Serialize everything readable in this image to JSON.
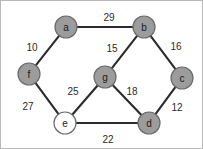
{
  "figure": {
    "background_color": "#ffffff",
    "border_color": "#b9b9b9",
    "edge_color": "#2b2b2b",
    "node_fill_gray": "#9c9c9c",
    "node_fill_white": "#ffffff",
    "node_stroke_color": "#6b6b6b",
    "label_color": "#1a1a1a"
  },
  "chart_data": {
    "type": "diagram",
    "subtype": "node-link-graph",
    "directed": false,
    "weighted": true,
    "title": "",
    "nodes": [
      {
        "id": "a",
        "label": "a",
        "x": 65,
        "y": 26,
        "r": 11,
        "fill": "#9c9c9c"
      },
      {
        "id": "b",
        "label": "b",
        "x": 143,
        "y": 26,
        "r": 11,
        "fill": "#9c9c9c"
      },
      {
        "id": "c",
        "label": "c",
        "x": 181,
        "y": 77,
        "r": 11,
        "fill": "#9c9c9c"
      },
      {
        "id": "d",
        "label": "d",
        "x": 148,
        "y": 122,
        "r": 11,
        "fill": "#9c9c9c"
      },
      {
        "id": "e",
        "label": "e",
        "x": 64,
        "y": 122,
        "r": 11,
        "fill": "#ffffff"
      },
      {
        "id": "f",
        "label": "f",
        "x": 28,
        "y": 73,
        "r": 11,
        "fill": "#9c9c9c"
      },
      {
        "id": "g",
        "label": "g",
        "x": 104,
        "y": 76,
        "r": 11,
        "fill": "#9c9c9c"
      }
    ],
    "edges": [
      {
        "source": "a",
        "target": "b",
        "weight": 29,
        "label_x": 108,
        "label_y": 16
      },
      {
        "source": "a",
        "target": "f",
        "weight": 10,
        "label_x": 31,
        "label_y": 46
      },
      {
        "source": "b",
        "target": "g",
        "weight": 15,
        "label_x": 111,
        "label_y": 47
      },
      {
        "source": "b",
        "target": "c",
        "weight": 16,
        "label_x": 175,
        "label_y": 45
      },
      {
        "source": "c",
        "target": "d",
        "weight": 12,
        "label_x": 176,
        "label_y": 106
      },
      {
        "source": "d",
        "target": "e",
        "weight": 22,
        "label_x": 107,
        "label_y": 138
      },
      {
        "source": "d",
        "target": "g",
        "weight": 18,
        "label_x": 131,
        "label_y": 90
      },
      {
        "source": "e",
        "target": "g",
        "weight": 25,
        "label_x": 72,
        "label_y": 90
      },
      {
        "source": "e",
        "target": "f",
        "weight": 27,
        "label_x": 27,
        "label_y": 105
      }
    ],
    "weights": [
      29,
      10,
      15,
      16,
      12,
      22,
      18,
      25,
      27
    ],
    "node_ids": [
      "a",
      "b",
      "c",
      "d",
      "e",
      "f",
      "g"
    ],
    "legend": [],
    "annotations": []
  }
}
